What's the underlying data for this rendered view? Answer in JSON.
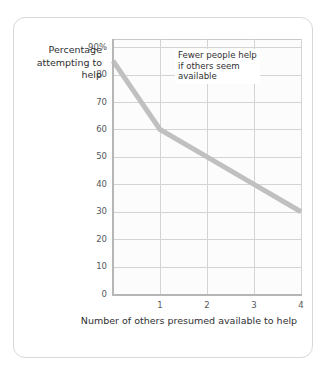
{
  "chart_data": {
    "type": "line",
    "title": "",
    "xlabel": "Number of others presumed available to help",
    "ylabel": "Percentage attempting to help",
    "x": [
      0,
      1,
      2,
      3,
      4
    ],
    "values": [
      85,
      60,
      50,
      40,
      30
    ],
    "series": [
      {
        "name": "Percentage attempting to help",
        "values": [
          85,
          60,
          50,
          40,
          30
        ]
      }
    ],
    "xlim": [
      0,
      4
    ],
    "ylim": [
      0,
      93
    ],
    "grid": true,
    "legend_position": "none",
    "line_color": "#c0c0c0",
    "annotations": [
      {
        "text": "Fewer people help\nif others seem\navailable",
        "x": 1.35,
        "y": 88
      }
    ],
    "xticks": [
      {
        "value": 1,
        "label": "1"
      },
      {
        "value": 2,
        "label": "2"
      },
      {
        "value": 3,
        "label": "3"
      },
      {
        "value": 4,
        "label": "4"
      }
    ],
    "yticks": [
      {
        "value": 90,
        "label": "90%"
      },
      {
        "value": 80,
        "label": "80"
      },
      {
        "value": 70,
        "label": "70"
      },
      {
        "value": 60,
        "label": "60"
      },
      {
        "value": 50,
        "label": "50"
      },
      {
        "value": 40,
        "label": "40"
      },
      {
        "value": 30,
        "label": "30"
      },
      {
        "value": 20,
        "label": "20"
      },
      {
        "value": 10,
        "label": "10"
      },
      {
        "value": 0,
        "label": "0"
      }
    ]
  },
  "axis_titles": {
    "y": "Percentage\nattempting\nto help",
    "x": "Number of others\npresumed available to help"
  },
  "annotation": {
    "text": "Fewer people help\nif others seem\navailable"
  }
}
